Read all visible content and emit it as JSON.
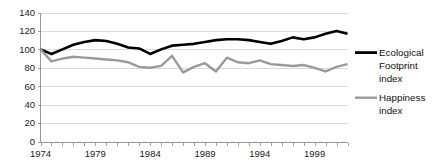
{
  "chart_data": {
    "type": "line",
    "title": "",
    "xlabel": "",
    "ylabel": "",
    "ylim": [
      0,
      140
    ],
    "xlim": [
      1974,
      2002
    ],
    "ytick_step": 20,
    "yticks": [
      0,
      20,
      40,
      60,
      80,
      100,
      120,
      140
    ],
    "ytick_labels": [
      "0",
      "20",
      "40",
      "60",
      "80",
      "100",
      "120",
      "140"
    ],
    "xticks": [
      1974,
      1979,
      1984,
      1989,
      1994,
      1999
    ],
    "xtick_labels": [
      "1974",
      "1979",
      "1984",
      "1989",
      "1994",
      "1999"
    ],
    "x": [
      1974,
      1975,
      1976,
      1977,
      1978,
      1979,
      1980,
      1981,
      1982,
      1983,
      1984,
      1985,
      1986,
      1987,
      1988,
      1989,
      1990,
      1991,
      1992,
      1993,
      1994,
      1995,
      1996,
      1997,
      1998,
      1999,
      2000,
      2001,
      2002
    ],
    "grid": true,
    "grid_axis": "y",
    "legend_position": "right",
    "series": [
      {
        "name": "Ecological Footprint index",
        "legend_label_lines": [
          "Ecological",
          "Footprint",
          "index"
        ],
        "color": "#000000",
        "line_width": 2.6,
        "values": [
          100,
          95,
          100,
          105,
          108,
          110,
          109,
          106,
          102,
          101,
          95,
          100,
          104,
          105,
          106,
          108,
          110,
          111,
          111,
          110,
          108,
          106,
          109,
          113,
          111,
          113,
          117,
          120,
          117
        ]
      },
      {
        "name": "Happiness index",
        "legend_label_lines": [
          "Happiness",
          "index"
        ],
        "color": "#9a9a9a",
        "line_width": 2.4,
        "values": [
          100,
          87,
          90,
          92,
          91,
          90,
          89,
          88,
          86,
          81,
          80,
          82,
          93,
          75,
          81,
          85,
          76,
          91,
          86,
          85,
          88,
          84,
          83,
          82,
          83,
          80,
          76,
          81,
          84
        ]
      }
    ]
  },
  "legend": {
    "items": [
      {
        "label_lines": [
          "Ecological",
          "Footprint",
          "index"
        ],
        "color": "#000000"
      },
      {
        "label_lines": [
          "Happiness",
          "index"
        ],
        "color": "#9a9a9a"
      }
    ]
  },
  "axes": {
    "y_axis_name": "value-axis",
    "x_axis_name": "year-axis"
  }
}
